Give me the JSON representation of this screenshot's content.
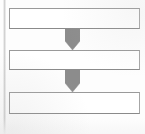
{
  "diagram": {
    "title": "",
    "type": "vertical-flowchart",
    "background_color": "#fdfdfd",
    "node_fill_color": "#ffffff",
    "node_border_color": "#8f8f8f",
    "arrow_color": "#8c8c8c",
    "nodes": [
      {
        "id": "node-1",
        "label": "",
        "x": 9,
        "y": 8,
        "width": 131,
        "height": 21
      },
      {
        "id": "node-2",
        "label": "",
        "x": 9,
        "y": 50,
        "width": 131,
        "height": 20
      },
      {
        "id": "node-3",
        "label": "",
        "x": 9,
        "y": 92,
        "width": 131,
        "height": 22
      }
    ],
    "connectors": [
      {
        "id": "connector-1",
        "from": "node-1",
        "to": "node-2",
        "shape": "pentagon-arrow-down",
        "x": 65,
        "y": 28,
        "width": 15,
        "height": 22
      },
      {
        "id": "connector-2",
        "from": "node-2",
        "to": "node-3",
        "shape": "pentagon-arrow-down",
        "x": 65,
        "y": 69,
        "width": 15,
        "height": 23
      }
    ]
  }
}
